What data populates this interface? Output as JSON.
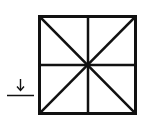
{
  "diagram": {
    "type": "square-with-diagonals-and-midlines",
    "square": {
      "x": 39,
      "y": 16,
      "size": 97
    },
    "stroke_color": "#111111",
    "background": "#ffffff",
    "arrow": {
      "glyph": "↓",
      "x": 20,
      "y_top": 79,
      "y_bottom": 91
    },
    "underline": {
      "x1": 7,
      "x2": 34,
      "y": 95
    }
  }
}
